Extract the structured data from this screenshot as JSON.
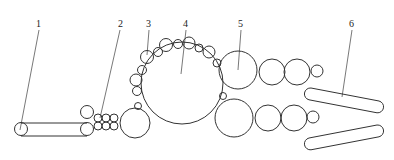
{
  "diagram": {
    "type": "roller train schematic",
    "labels": [
      {
        "id": "1",
        "text": "1",
        "x": 39,
        "y": 28
      },
      {
        "id": "2",
        "text": "2",
        "x": 121,
        "y": 28
      },
      {
        "id": "3",
        "text": "3",
        "x": 149,
        "y": 28
      },
      {
        "id": "4",
        "text": "4",
        "x": 186,
        "y": 28
      },
      {
        "id": "5",
        "text": "5",
        "x": 241,
        "y": 28
      },
      {
        "id": "6",
        "text": "6",
        "x": 352,
        "y": 28
      }
    ],
    "colors": {
      "stroke": "#333333",
      "background": "#ffffff"
    }
  }
}
